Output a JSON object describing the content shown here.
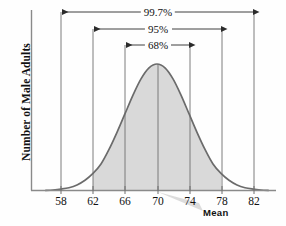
{
  "chart_data": {
    "type": "area",
    "title": "",
    "subtitle": "",
    "xlabel": "",
    "ylabel": "Number of Male Adults",
    "distribution": "normal",
    "mean": 70,
    "sd": 4,
    "xlim": [
      56,
      84
    ],
    "ylim": [
      0,
      1.12
    ],
    "x_ticks": [
      58,
      62,
      66,
      70,
      74,
      78,
      82
    ],
    "x_tick_labels": [
      "58",
      "62",
      "66",
      "70",
      "74",
      "78",
      "82"
    ],
    "grid": false,
    "legend": null,
    "shaded_range": [
      62,
      78
    ],
    "shade_color": "#d9d9d9",
    "curve_color": "#6b6b6b",
    "axis_color": "#8a8a8a",
    "annotations": [
      {
        "label": "99.7%",
        "from": 58,
        "to": 82,
        "level": 1
      },
      {
        "label": "95%",
        "from": 62,
        "to": 78,
        "level": 2
      },
      {
        "label": "68%",
        "from": 66,
        "to": 74,
        "level": 3
      }
    ],
    "callout": {
      "label": "Mean",
      "points_to": 70
    },
    "vertical_lines": [
      58,
      62,
      66,
      70,
      74,
      78,
      82
    ],
    "curve_points": [
      {
        "x": 56,
        "y": 0.0
      },
      {
        "x": 57,
        "y": 0.004
      },
      {
        "x": 58,
        "y": 0.011
      },
      {
        "x": 59,
        "y": 0.022
      },
      {
        "x": 60,
        "y": 0.044
      },
      {
        "x": 61,
        "y": 0.081
      },
      {
        "x": 62,
        "y": 0.135
      },
      {
        "x": 63,
        "y": 0.21
      },
      {
        "x": 64,
        "y": 0.325
      },
      {
        "x": 65,
        "y": 0.46
      },
      {
        "x": 66,
        "y": 0.607
      },
      {
        "x": 67,
        "y": 0.754
      },
      {
        "x": 68,
        "y": 0.882
      },
      {
        "x": 69,
        "y": 0.969
      },
      {
        "x": 70,
        "y": 1.0
      },
      {
        "x": 71,
        "y": 0.969
      },
      {
        "x": 72,
        "y": 0.882
      },
      {
        "x": 73,
        "y": 0.754
      },
      {
        "x": 74,
        "y": 0.607
      },
      {
        "x": 75,
        "y": 0.46
      },
      {
        "x": 76,
        "y": 0.325
      },
      {
        "x": 77,
        "y": 0.21
      },
      {
        "x": 78,
        "y": 0.135
      },
      {
        "x": 79,
        "y": 0.081
      },
      {
        "x": 80,
        "y": 0.044
      },
      {
        "x": 81,
        "y": 0.022
      },
      {
        "x": 82,
        "y": 0.011
      },
      {
        "x": 83,
        "y": 0.004
      },
      {
        "x": 84,
        "y": 0.0
      }
    ]
  },
  "axis": {
    "y_title": "Number of Male Adults"
  },
  "ticks": {
    "t0": "58",
    "t1": "62",
    "t2": "66",
    "t3": "70",
    "t4": "74",
    "t5": "78",
    "t6": "82"
  },
  "brackets": {
    "b997": "99.7%",
    "b95": "95%",
    "b68": "68%"
  },
  "callout": {
    "mean_label": "Mean"
  }
}
